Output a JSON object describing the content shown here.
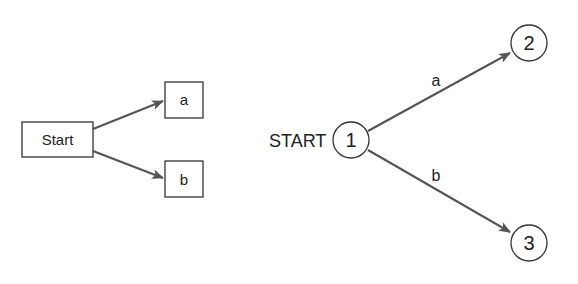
{
  "left_diagram": {
    "start_box": {
      "label": "Start"
    },
    "boxes": [
      {
        "id": "a",
        "label": "a"
      },
      {
        "id": "b",
        "label": "b"
      }
    ],
    "edges": [
      {
        "from": "Start",
        "to": "a"
      },
      {
        "from": "Start",
        "to": "b"
      }
    ]
  },
  "right_diagram": {
    "start_label": "START",
    "nodes": [
      {
        "id": "1",
        "label": "1"
      },
      {
        "id": "2",
        "label": "2"
      },
      {
        "id": "3",
        "label": "3"
      }
    ],
    "edges": [
      {
        "from": "1",
        "to": "2",
        "label": "a"
      },
      {
        "from": "1",
        "to": "3",
        "label": "b"
      }
    ]
  },
  "colors": {
    "stroke": "#333333",
    "arrow": "#555555",
    "background": "#ffffff"
  }
}
